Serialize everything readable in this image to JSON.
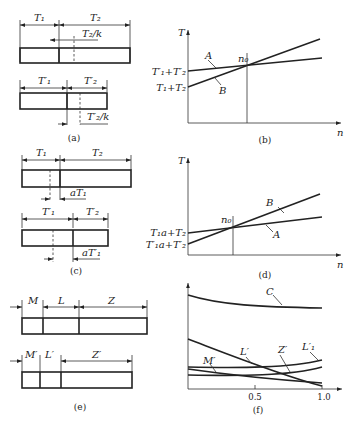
{
  "panels": {
    "a": {
      "caption": "(a)",
      "top": {
        "seg1": "T₁",
        "seg2": "T₂",
        "shift": "T₂/k"
      },
      "bottom": {
        "seg1": "T′₁",
        "seg2": "T′₂",
        "shift": "T′₂/k"
      }
    },
    "b": {
      "caption": "(b)",
      "y_axis": "T",
      "x_axis": "n",
      "intersection": "n₀",
      "line_a": "A",
      "line_b": "B",
      "intercept_a": "T′₁+T′₂",
      "intercept_b": "T₁+T₂"
    },
    "c": {
      "caption": "(c)",
      "top": {
        "seg1": "T₁",
        "seg2": "T₂",
        "shift": "aT₁"
      },
      "bottom": {
        "seg1": "T′₁",
        "seg2": "T′₂",
        "shift": "aT′₁"
      }
    },
    "d": {
      "caption": "(d)",
      "y_axis": "T",
      "x_axis": "n",
      "intersection": "n₀",
      "line_a": "A",
      "line_b": "B",
      "intercept_a": "T₁a+T₂",
      "intercept_b": "T′₁a+T′₂"
    },
    "e": {
      "caption": "(e)",
      "top": {
        "seg1": "M",
        "seg2": "L",
        "seg3": "Z"
      },
      "bottom": {
        "seg1": "M′",
        "seg2": "L′",
        "seg3": "Z′"
      }
    },
    "f": {
      "caption": "(f)",
      "curves": [
        "C",
        "L′",
        "Z′",
        "L′₁",
        "M′"
      ],
      "x_ticks": [
        "0.5",
        "1.0"
      ]
    }
  }
}
